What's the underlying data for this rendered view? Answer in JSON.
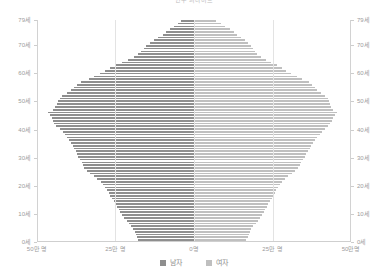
{
  "chart_data": {
    "type": "bar",
    "subtype": "population-pyramid",
    "title": "인구 피라미드",
    "xlabel": "",
    "ylabel": "",
    "orientation": "horizontal-diverging",
    "grid": true,
    "legend_position": "bottom",
    "center_value": 0,
    "xlim": [
      -500000,
      500000
    ],
    "xtick_values": [
      -500000,
      -250000,
      0,
      250000,
      500000
    ],
    "xtick_labels": [
      "50만 명",
      "25만 명",
      "0명",
      "25만 명",
      "50만명"
    ],
    "ylim": [
      0,
      79
    ],
    "ytick_values": [
      0,
      10,
      20,
      30,
      40,
      50,
      60,
      70,
      79
    ],
    "ytick_labels": [
      "0세",
      "10세",
      "20세",
      "30세",
      "40세",
      "50세",
      "60세",
      "70세",
      "79세"
    ],
    "unit": "명",
    "legend": [
      "남자",
      "여자"
    ],
    "colors": {
      "male": "#8e8e8e",
      "female": "#bfbfbf",
      "grid": "#e3e3e3",
      "axis": "#d2d2d2",
      "text": "#9b9b9b"
    },
    "categories": [
      0,
      1,
      2,
      3,
      4,
      5,
      6,
      7,
      8,
      9,
      10,
      11,
      12,
      13,
      14,
      15,
      16,
      17,
      18,
      19,
      20,
      21,
      22,
      23,
      24,
      25,
      26,
      27,
      28,
      29,
      30,
      31,
      32,
      33,
      34,
      35,
      36,
      37,
      38,
      39,
      40,
      41,
      42,
      43,
      44,
      45,
      46,
      47,
      48,
      49,
      50,
      51,
      52,
      53,
      54,
      55,
      56,
      57,
      58,
      59,
      60,
      61,
      62,
      63,
      64,
      65,
      66,
      67,
      68,
      69,
      70,
      71,
      72,
      73,
      74,
      75,
      76,
      77,
      78,
      79
    ],
    "series": [
      {
        "name": "남자",
        "side": "left",
        "values": [
          177000,
          181000,
          185000,
          189000,
          193000,
          200000,
          207000,
          214000,
          222000,
          229000,
          235000,
          240000,
          244000,
          249000,
          255000,
          261000,
          266000,
          271000,
          277000,
          283000,
          290000,
          297000,
          308000,
          319000,
          330000,
          340000,
          350000,
          355000,
          358000,
          362000,
          368000,
          372000,
          376000,
          381000,
          386000,
          392000,
          399000,
          406000,
          412000,
          418000,
          427000,
          438000,
          445000,
          448000,
          452000,
          458000,
          464000,
          450000,
          442000,
          437000,
          432000,
          428000,
          419000,
          405000,
          392000,
          382000,
          372000,
          360000,
          336000,
          318000,
          300000,
          282000,
          266000,
          248000,
          228000,
          210000,
          192000,
          178000,
          168000,
          160000,
          152000,
          140000,
          128000,
          114000,
          100000,
          88000,
          76000,
          64000,
          52000,
          40000
        ]
      },
      {
        "name": "여자",
        "side": "right",
        "values": [
          167000,
          171000,
          175000,
          179000,
          183000,
          189000,
          196000,
          203000,
          210000,
          216000,
          222000,
          227000,
          231000,
          236000,
          241000,
          247000,
          252000,
          257000,
          262000,
          267000,
          273000,
          280000,
          290000,
          300000,
          311000,
          322000,
          332000,
          338000,
          342000,
          347000,
          353000,
          358000,
          363000,
          368000,
          373000,
          379000,
          386000,
          393000,
          400000,
          407000,
          416000,
          427000,
          434000,
          438000,
          443000,
          450000,
          456000,
          444000,
          437000,
          433000,
          429000,
          426000,
          418000,
          405000,
          393000,
          384000,
          376000,
          366000,
          343000,
          327000,
          310000,
          294000,
          279000,
          263000,
          245000,
          229000,
          213000,
          201000,
          193000,
          187000,
          181000,
          172000,
          162000,
          150000,
          138000,
          126000,
          114000,
          100000,
          86000,
          70000
        ]
      }
    ]
  },
  "axes": {
    "left_title": "",
    "right_title": ""
  }
}
